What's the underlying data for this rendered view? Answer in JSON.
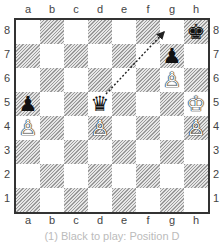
{
  "board": {
    "files": [
      "a",
      "b",
      "c",
      "d",
      "e",
      "f",
      "g",
      "h"
    ],
    "ranks": [
      "8",
      "7",
      "6",
      "5",
      "4",
      "3",
      "2",
      "1"
    ],
    "pieces": [
      {
        "square": "h8",
        "color": "black",
        "type": "king",
        "glyph": "♚"
      },
      {
        "square": "g7",
        "color": "black",
        "type": "pawn",
        "glyph": "♟"
      },
      {
        "square": "g6",
        "color": "white",
        "type": "pawn",
        "glyph": "♙"
      },
      {
        "square": "d5",
        "color": "black",
        "type": "queen",
        "glyph": "♛"
      },
      {
        "square": "h5",
        "color": "white",
        "type": "king",
        "glyph": "♔"
      },
      {
        "square": "a5",
        "color": "black",
        "type": "pawn",
        "glyph": "♟"
      },
      {
        "square": "a4",
        "color": "white",
        "type": "pawn",
        "glyph": "♙"
      },
      {
        "square": "d4",
        "color": "white",
        "type": "pawn",
        "glyph": "♙"
      },
      {
        "square": "h4",
        "color": "white",
        "type": "pawn",
        "glyph": "♙"
      }
    ],
    "arrows": [
      {
        "from": "d5",
        "to": "g8",
        "style": "dotted"
      }
    ]
  },
  "caption": {
    "text": "(1) Black to play: Position D"
  }
}
